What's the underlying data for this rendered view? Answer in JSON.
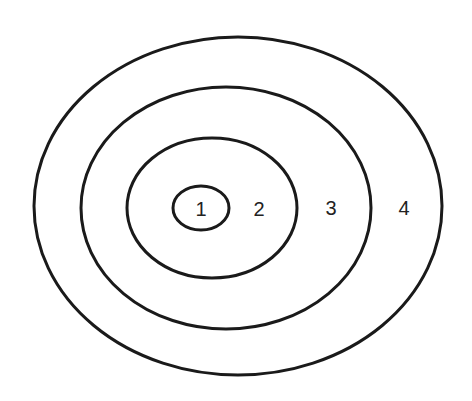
{
  "diagram": {
    "type": "concentric-ellipses",
    "stroke_color": "#1a1a1a",
    "background": "#ffffff",
    "rings": [
      {
        "id": 1,
        "label": "1",
        "cx": 201,
        "cy": 208,
        "rx": 28,
        "ry": 22,
        "label_x": 201,
        "label_y": 209
      },
      {
        "id": 2,
        "label": "2",
        "cx": 212,
        "cy": 208,
        "rx": 85,
        "ry": 70,
        "label_x": 259,
        "label_y": 209
      },
      {
        "id": 3,
        "label": "3",
        "cx": 226,
        "cy": 208,
        "rx": 145,
        "ry": 121,
        "label_x": 331,
        "label_y": 208
      },
      {
        "id": 4,
        "label": "4",
        "cx": 238,
        "cy": 206,
        "rx": 204,
        "ry": 169,
        "label_x": 404,
        "label_y": 208
      }
    ]
  }
}
